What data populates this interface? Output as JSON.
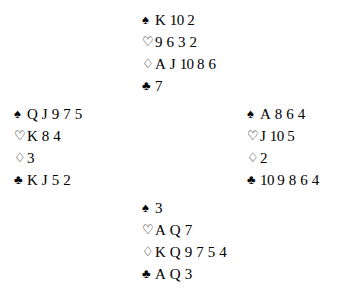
{
  "diagram": {
    "type": "bridge-deal",
    "background_color": "#ffffff",
    "text_color": "#000000",
    "suits": [
      {
        "key": "spades",
        "name": "spade-suit-symbol",
        "glyph": "♠",
        "fill": "solid"
      },
      {
        "key": "hearts",
        "name": "heart-suit-symbol",
        "glyph": "♡",
        "fill": "hollow"
      },
      {
        "key": "diamonds",
        "name": "diamond-suit-symbol",
        "glyph": "♢",
        "fill": "hollow"
      },
      {
        "key": "clubs",
        "name": "club-suit-symbol",
        "glyph": "♣",
        "fill": "solid"
      }
    ],
    "hands": {
      "north": {
        "position": "north",
        "spades": [
          "K",
          "10",
          "2"
        ],
        "hearts": [
          "9",
          "6",
          "3",
          "2"
        ],
        "diamonds": [
          "A",
          "J",
          "10",
          "8",
          "6"
        ],
        "clubs": [
          "7"
        ]
      },
      "west": {
        "position": "west",
        "spades": [
          "Q",
          "J",
          "9",
          "7",
          "5"
        ],
        "hearts": [
          "K",
          "8",
          "4"
        ],
        "diamonds": [
          "3"
        ],
        "clubs": [
          "K",
          "J",
          "5",
          "2"
        ]
      },
      "east": {
        "position": "east",
        "spades": [
          "A",
          "8",
          "6",
          "4"
        ],
        "hearts": [
          "J",
          "10",
          "5"
        ],
        "diamonds": [
          "2"
        ],
        "clubs": [
          "10",
          "9",
          "8",
          "6",
          "4"
        ]
      },
      "south": {
        "position": "south",
        "spades": [
          "3"
        ],
        "hearts": [
          "A",
          "Q",
          "7"
        ],
        "diamonds": [
          "K",
          "Q",
          "9",
          "7",
          "5",
          "4"
        ],
        "clubs": [
          "A",
          "Q",
          "3"
        ]
      }
    }
  }
}
